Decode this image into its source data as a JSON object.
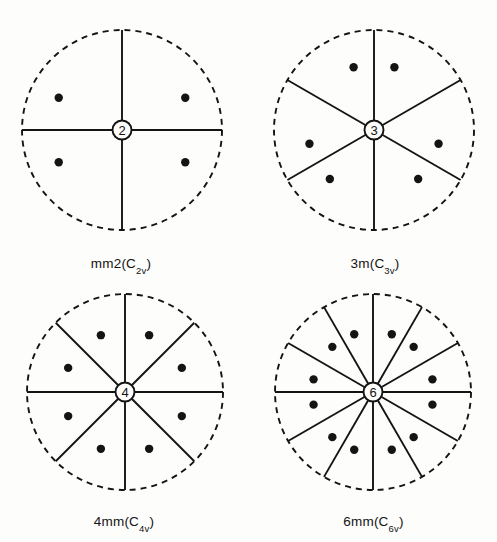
{
  "figure": {
    "caption_style": "crystallographic-stereograms",
    "background_color": "#fdfdfc",
    "ink_color": "#141414",
    "panel_count": 4
  },
  "chart_data": {
    "type": "scatter",
    "title": "",
    "xlabel": "",
    "ylabel": "",
    "panels": [
      {
        "id": "mm2",
        "label_main": "mm2",
        "label_paren_open": "(",
        "label_schoenflies": "C",
        "label_sub": "2v",
        "label_paren_close": ")",
        "label_full": "mm2(C2v)",
        "center_symbol": "2",
        "rotation_order": 2,
        "mirror_count": 2,
        "radius": 100,
        "dot_count": 4,
        "dot_radius_frac": 0.71,
        "dot_marker_r": 4.2,
        "dot_angles_deg": [
          27,
          153,
          207,
          333
        ],
        "mirror_angles_deg": [
          0,
          90
        ],
        "radii_angles_deg": [
          0,
          90,
          180,
          270
        ]
      },
      {
        "id": "3m",
        "label_main": "3m",
        "label_paren_open": "(",
        "label_schoenflies": "C",
        "label_sub": "3v",
        "label_paren_close": ")",
        "label_full": "3m(C3v)",
        "center_symbol": "3",
        "rotation_order": 3,
        "mirror_count": 3,
        "radius": 100,
        "dot_count": 6,
        "dot_radius_frac": 0.66,
        "dot_marker_r": 4.2,
        "dot_angles_deg": [
          72,
          108,
          192,
          228,
          312,
          348
        ],
        "mirror_angles_deg": [
          90,
          210,
          330
        ],
        "radii_angles_deg": [
          30,
          90,
          150,
          210,
          270,
          330
        ]
      },
      {
        "id": "4mm",
        "label_main": "4mm",
        "label_paren_open": "(",
        "label_schoenflies": "C",
        "label_sub": "4v",
        "label_paren_close": ")",
        "label_full": "4mm(C4v)",
        "center_symbol": "4",
        "rotation_order": 4,
        "mirror_count": 4,
        "radius": 98,
        "dot_count": 8,
        "dot_radius_frac": 0.63,
        "dot_marker_r": 4.2,
        "dot_angles_deg": [
          23,
          67,
          113,
          157,
          203,
          247,
          293,
          337
        ],
        "mirror_angles_deg": [
          0,
          45,
          90,
          135
        ],
        "radii_angles_deg": [
          0,
          45,
          90,
          135,
          180,
          225,
          270,
          315
        ]
      },
      {
        "id": "6mm",
        "label_main": "6mm",
        "label_paren_open": "(",
        "label_schoenflies": "C",
        "label_sub": "6v",
        "label_paren_close": ")",
        "label_full": "6mm(C6v)",
        "center_symbol": "6",
        "rotation_order": 6,
        "mirror_count": 6,
        "radius": 98,
        "dot_count": 12,
        "dot_radius_frac": 0.62,
        "dot_marker_r": 4.2,
        "dot_angles_deg": [
          12,
          48,
          72,
          108,
          132,
          168,
          192,
          228,
          252,
          288,
          312,
          348
        ],
        "mirror_angles_deg": [
          0,
          30,
          60,
          90,
          120,
          150
        ],
        "radii_angles_deg": [
          0,
          30,
          60,
          90,
          120,
          150,
          180,
          210,
          240,
          270,
          300,
          330
        ]
      }
    ],
    "style": {
      "primitive_circle": "dashed",
      "dash_length": 6,
      "dash_gap": 5,
      "stroke_width": 1.9,
      "center_symbol_circle_r": 9.5,
      "center_symbol_font_size": 13
    }
  }
}
